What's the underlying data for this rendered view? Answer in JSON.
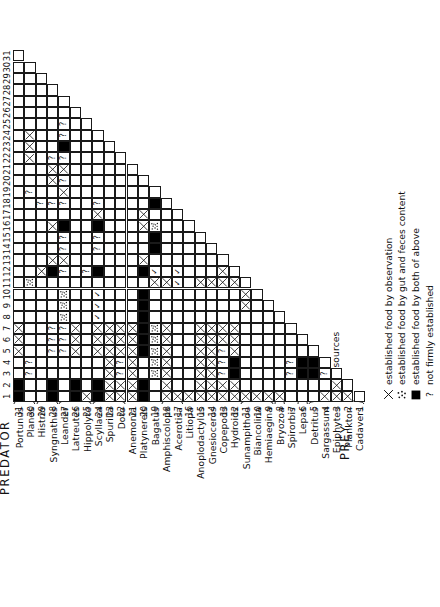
{
  "figure": {
    "predator_axis_label": "PREDATOR",
    "prey_axis_label": "PREY"
  },
  "taxa": [
    {
      "n": 1,
      "name": "Portunus"
    },
    {
      "n": 2,
      "name": "Planes"
    },
    {
      "n": 3,
      "name": "Histrio"
    },
    {
      "n": 4,
      "name": "Syngnathus"
    },
    {
      "n": 5,
      "name": "Leander"
    },
    {
      "n": 6,
      "name": "Latreutes"
    },
    {
      "n": 7,
      "name": "Hippolyte"
    },
    {
      "n": 8,
      "name": "Scyllaea"
    },
    {
      "n": 9,
      "name": "Spurilla"
    },
    {
      "n": 10,
      "name": "Doto"
    },
    {
      "n": 11,
      "name": "Anemonia"
    },
    {
      "n": 12,
      "name": "Platynereis"
    },
    {
      "n": 13,
      "name": "Bagatus"
    },
    {
      "n": 14,
      "name": "Amphiscolops"
    },
    {
      "n": 15,
      "name": "Acerotisa"
    },
    {
      "n": 16,
      "name": "Litiopa"
    },
    {
      "n": 17,
      "name": "Anoplodactylus"
    },
    {
      "n": 18,
      "name": "Gnesioceros"
    },
    {
      "n": 19,
      "name": "Copepods"
    },
    {
      "n": 20,
      "name": "Hydroids"
    },
    {
      "n": 21,
      "name": "Sunampithoe"
    },
    {
      "n": 22,
      "name": "Biancolina"
    },
    {
      "n": 23,
      "name": "Hemiaegina"
    },
    {
      "n": 24,
      "name": "Bryozoa"
    },
    {
      "n": 25,
      "name": "Spirorbis"
    },
    {
      "n": 26,
      "name": "Lepas"
    },
    {
      "n": 27,
      "name": "Detritus"
    },
    {
      "n": 28,
      "name": "Sargassum"
    },
    {
      "n": 29,
      "name": "Epiphytes"
    },
    {
      "n": 30,
      "name": "Plankton"
    },
    {
      "n": 31,
      "name": "Cadavers"
    }
  ],
  "groups": [
    {
      "label": "Crabs",
      "from": 1,
      "to": 2
    },
    {
      "label": "Fish",
      "from": 3,
      "to": 4
    },
    {
      "label": "Shrimp",
      "from": 5,
      "to": 7
    },
    {
      "label": "Nudibranches",
      "from": 8,
      "to": 10
    },
    {
      "label": "Flatworms",
      "from": 14,
      "to": 15
    },
    {
      "label": "Amphipods",
      "from": 21,
      "to": 23
    },
    {
      "label": "Tapeworm",
      "from": 24,
      "to": 24
    },
    {
      "label": "Barnacle",
      "from": 26,
      "to": 26
    },
    {
      "label": "Food sources",
      "from": 27,
      "to": 31
    }
  ],
  "legend": [
    {
      "key": "x",
      "text": "established food by observation"
    },
    {
      "key": "dots",
      "text": "established food by gut and feces content"
    },
    {
      "key": "solid",
      "text": "established food by both of above"
    },
    {
      "key": "q",
      "text": "not firmly established"
    }
  ],
  "chart_data": {
    "type": "heatmap",
    "xlabel": "PREDATOR",
    "ylabel": "PREY",
    "x": [
      1,
      2,
      3,
      4,
      5,
      6,
      7,
      8,
      9,
      10,
      11,
      12,
      13,
      14,
      15,
      16,
      17,
      18,
      19,
      20,
      21,
      22,
      23,
      24,
      25,
      26,
      27,
      28,
      29,
      30,
      31
    ],
    "y": [
      1,
      2,
      3,
      4,
      5,
      6,
      7,
      8,
      9,
      10,
      11,
      12,
      13,
      14,
      15,
      16,
      17,
      18,
      19,
      20,
      21,
      22,
      23,
      24,
      25,
      26,
      27,
      28,
      29,
      30,
      31
    ],
    "symbols": {
      "x": "established food by observation",
      "dots": "established food by gut and feces content",
      "solid": "established food by both of above",
      "q": "not firmly established",
      "empty": "no record"
    },
    "note": "Lower-left triangular matrix: cells exist where prey row index <= predator column index boundary (staircase).",
    "cells": [
      {
        "prey": 31,
        "predator": 1,
        "v": "solid"
      },
      {
        "prey": 31,
        "predator": 2,
        "v": "solid"
      },
      {
        "prey": 31,
        "predator": 5,
        "v": "x"
      },
      {
        "prey": 31,
        "predator": 6,
        "v": "x"
      },
      {
        "prey": 31,
        "predator": 7,
        "v": "x"
      },
      {
        "prey": 30,
        "predator": 3,
        "v": "q"
      },
      {
        "prey": 30,
        "predator": 4,
        "v": "q"
      },
      {
        "prey": 30,
        "predator": 11,
        "v": "dots"
      },
      {
        "prey": 30,
        "predator": 19,
        "v": "q"
      },
      {
        "prey": 30,
        "predator": 22,
        "v": "x"
      },
      {
        "prey": 30,
        "predator": 23,
        "v": "x"
      },
      {
        "prey": 30,
        "predator": 24,
        "v": "x"
      },
      {
        "prey": 29,
        "predator": 12,
        "v": "x"
      },
      {
        "prey": 29,
        "predator": 18,
        "v": "q"
      },
      {
        "prey": 28,
        "predator": 1,
        "v": "solid"
      },
      {
        "prey": 28,
        "predator": 2,
        "v": "solid"
      },
      {
        "prey": 28,
        "predator": 5,
        "v": "q"
      },
      {
        "prey": 28,
        "predator": 6,
        "v": "q"
      },
      {
        "prey": 28,
        "predator": 7,
        "v": "q"
      },
      {
        "prey": 28,
        "predator": 12,
        "v": "solid"
      },
      {
        "prey": 28,
        "predator": 13,
        "v": "x"
      },
      {
        "prey": 28,
        "predator": 16,
        "v": "x"
      },
      {
        "prey": 28,
        "predator": 18,
        "v": "q"
      },
      {
        "prey": 28,
        "predator": 20,
        "v": "x"
      },
      {
        "prey": 28,
        "predator": 21,
        "v": "x"
      },
      {
        "prey": 28,
        "predator": 22,
        "v": "q"
      },
      {
        "prey": 27,
        "predator": 5,
        "v": "q"
      },
      {
        "prey": 27,
        "predator": 6,
        "v": "q"
      },
      {
        "prey": 27,
        "predator": 7,
        "v": "q"
      },
      {
        "prey": 27,
        "predator": 8,
        "v": "dots"
      },
      {
        "prey": 27,
        "predator": 9,
        "v": "dots"
      },
      {
        "prey": 27,
        "predator": 10,
        "v": "dots"
      },
      {
        "prey": 27,
        "predator": 12,
        "v": "q"
      },
      {
        "prey": 27,
        "predator": 13,
        "v": "x"
      },
      {
        "prey": 27,
        "predator": 14,
        "v": "q"
      },
      {
        "prey": 27,
        "predator": 15,
        "v": "q"
      },
      {
        "prey": 27,
        "predator": 16,
        "v": "solid"
      },
      {
        "prey": 27,
        "predator": 18,
        "v": "q"
      },
      {
        "prey": 27,
        "predator": 19,
        "v": "x"
      },
      {
        "prey": 27,
        "predator": 20,
        "v": "q"
      },
      {
        "prey": 27,
        "predator": 21,
        "v": "x"
      },
      {
        "prey": 27,
        "predator": 22,
        "v": "q"
      },
      {
        "prey": 27,
        "predator": 23,
        "v": "solid"
      },
      {
        "prey": 27,
        "predator": 24,
        "v": "q"
      },
      {
        "prey": 27,
        "predator": 25,
        "v": "q"
      },
      {
        "prey": 26,
        "predator": 1,
        "v": "solid"
      },
      {
        "prey": 26,
        "predator": 2,
        "v": "solid"
      },
      {
        "prey": 26,
        "predator": 5,
        "v": "x"
      },
      {
        "prey": 26,
        "predator": 6,
        "v": "x"
      },
      {
        "prey": 26,
        "predator": 7,
        "v": "x"
      },
      {
        "prey": 25,
        "predator": 1,
        "v": "x"
      },
      {
        "prey": 25,
        "predator": 12,
        "v": "q"
      },
      {
        "prey": 24,
        "predator": 1,
        "v": "solid"
      },
      {
        "prey": 24,
        "predator": 2,
        "v": "solid"
      },
      {
        "prey": 24,
        "predator": 5,
        "v": "x"
      },
      {
        "prey": 24,
        "predator": 6,
        "v": "x"
      },
      {
        "prey": 24,
        "predator": 7,
        "v": "x"
      },
      {
        "prey": 24,
        "predator": 8,
        "v": "chk"
      },
      {
        "prey": 24,
        "predator": 9,
        "v": "chk"
      },
      {
        "prey": 24,
        "predator": 10,
        "v": "chk"
      },
      {
        "prey": 24,
        "predator": 12,
        "v": "solid"
      },
      {
        "prey": 24,
        "predator": 14,
        "v": "q"
      },
      {
        "prey": 24,
        "predator": 15,
        "v": "q"
      },
      {
        "prey": 24,
        "predator": 16,
        "v": "solid"
      },
      {
        "prey": 24,
        "predator": 17,
        "v": "x"
      },
      {
        "prey": 24,
        "predator": 18,
        "v": "q"
      },
      {
        "prey": 23,
        "predator": 1,
        "v": "x"
      },
      {
        "prey": 23,
        "predator": 2,
        "v": "x"
      },
      {
        "prey": 23,
        "predator": 3,
        "v": "x"
      },
      {
        "prey": 23,
        "predator": 4,
        "v": "x"
      },
      {
        "prey": 23,
        "predator": 5,
        "v": "x"
      },
      {
        "prey": 23,
        "predator": 6,
        "v": "x"
      },
      {
        "prey": 23,
        "predator": 7,
        "v": "x"
      },
      {
        "prey": 22,
        "predator": 1,
        "v": "x"
      },
      {
        "prey": 22,
        "predator": 2,
        "v": "x"
      },
      {
        "prey": 22,
        "predator": 3,
        "v": "q"
      },
      {
        "prey": 22,
        "predator": 4,
        "v": "q"
      },
      {
        "prey": 22,
        "predator": 5,
        "v": "x"
      },
      {
        "prey": 22,
        "predator": 6,
        "v": "x"
      },
      {
        "prey": 22,
        "predator": 7,
        "v": "x"
      },
      {
        "prey": 21,
        "predator": 1,
        "v": "x"
      },
      {
        "prey": 21,
        "predator": 2,
        "v": "x"
      },
      {
        "prey": 21,
        "predator": 3,
        "v": "x"
      },
      {
        "prey": 21,
        "predator": 4,
        "v": "x"
      },
      {
        "prey": 21,
        "predator": 5,
        "v": "x"
      },
      {
        "prey": 21,
        "predator": 6,
        "v": "x"
      },
      {
        "prey": 21,
        "predator": 7,
        "v": "x"
      },
      {
        "prey": 20,
        "predator": 1,
        "v": "solid"
      },
      {
        "prey": 20,
        "predator": 2,
        "v": "solid"
      },
      {
        "prey": 20,
        "predator": 5,
        "v": "solid"
      },
      {
        "prey": 20,
        "predator": 6,
        "v": "solid"
      },
      {
        "prey": 20,
        "predator": 7,
        "v": "solid"
      },
      {
        "prey": 20,
        "predator": 8,
        "v": "solid"
      },
      {
        "prey": 20,
        "predator": 9,
        "v": "solid"
      },
      {
        "prey": 20,
        "predator": 10,
        "v": "solid"
      },
      {
        "prey": 20,
        "predator": 12,
        "v": "solid"
      },
      {
        "prey": 20,
        "predator": 13,
        "v": "x"
      },
      {
        "prey": 20,
        "predator": 16,
        "v": "x"
      },
      {
        "prey": 20,
        "predator": 17,
        "v": "x"
      },
      {
        "prey": 19,
        "predator": 3,
        "v": "dots"
      },
      {
        "prey": 19,
        "predator": 4,
        "v": "dots"
      },
      {
        "prey": 19,
        "predator": 5,
        "v": "dots"
      },
      {
        "prey": 19,
        "predator": 6,
        "v": "dots"
      },
      {
        "prey": 19,
        "predator": 7,
        "v": "dots"
      },
      {
        "prey": 19,
        "predator": 11,
        "v": "x"
      },
      {
        "prey": 19,
        "predator": 12,
        "v": "chk"
      },
      {
        "prey": 19,
        "predator": 14,
        "v": "solid"
      },
      {
        "prey": 19,
        "predator": 15,
        "v": "solid"
      },
      {
        "prey": 19,
        "predator": 16,
        "v": "dots"
      },
      {
        "prey": 19,
        "predator": 18,
        "v": "solid"
      },
      {
        "prey": 18,
        "predator": 1,
        "v": "x"
      },
      {
        "prey": 18,
        "predator": 2,
        "v": "x"
      },
      {
        "prey": 18,
        "predator": 3,
        "v": "x"
      },
      {
        "prey": 18,
        "predator": 4,
        "v": "x"
      },
      {
        "prey": 18,
        "predator": 5,
        "v": "x"
      },
      {
        "prey": 18,
        "predator": 6,
        "v": "x"
      },
      {
        "prey": 18,
        "predator": 7,
        "v": "x"
      },
      {
        "prey": 18,
        "predator": 11,
        "v": "x"
      },
      {
        "prey": 17,
        "predator": 1,
        "v": "x"
      },
      {
        "prey": 17,
        "predator": 11,
        "v": "chk"
      },
      {
        "prey": 17,
        "predator": 12,
        "v": "chk"
      },
      {
        "prey": 16,
        "predator": 1,
        "v": "x"
      },
      {
        "prey": 15,
        "predator": 1,
        "v": "x"
      },
      {
        "prey": 15,
        "predator": 2,
        "v": "x"
      },
      {
        "prey": 15,
        "predator": 3,
        "v": "x"
      },
      {
        "prey": 15,
        "predator": 4,
        "v": "x"
      },
      {
        "prey": 15,
        "predator": 5,
        "v": "x"
      },
      {
        "prey": 15,
        "predator": 6,
        "v": "x"
      },
      {
        "prey": 15,
        "predator": 7,
        "v": "x"
      },
      {
        "prey": 15,
        "predator": 11,
        "v": "x"
      },
      {
        "prey": 14,
        "predator": 1,
        "v": "x"
      },
      {
        "prey": 14,
        "predator": 2,
        "v": "x"
      },
      {
        "prey": 14,
        "predator": 3,
        "v": "x"
      },
      {
        "prey": 14,
        "predator": 4,
        "v": "x"
      },
      {
        "prey": 14,
        "predator": 5,
        "v": "x"
      },
      {
        "prey": 14,
        "predator": 6,
        "v": "x"
      },
      {
        "prey": 14,
        "predator": 7,
        "v": "x"
      },
      {
        "prey": 14,
        "predator": 11,
        "v": "x"
      },
      {
        "prey": 13,
        "predator": 1,
        "v": "x"
      },
      {
        "prey": 13,
        "predator": 2,
        "v": "x"
      },
      {
        "prey": 13,
        "predator": 3,
        "v": "q"
      },
      {
        "prey": 13,
        "predator": 4,
        "v": "q"
      },
      {
        "prey": 13,
        "predator": 5,
        "v": "q"
      },
      {
        "prey": 13,
        "predator": 6,
        "v": "x"
      },
      {
        "prey": 13,
        "predator": 7,
        "v": "x"
      },
      {
        "prey": 13,
        "predator": 11,
        "v": "x"
      },
      {
        "prey": 13,
        "predator": 12,
        "v": "x"
      },
      {
        "prey": 12,
        "predator": 1,
        "v": "x"
      },
      {
        "prey": 12,
        "predator": 2,
        "v": "x"
      },
      {
        "prey": 12,
        "predator": 3,
        "v": "solid"
      },
      {
        "prey": 12,
        "predator": 4,
        "v": "solid"
      },
      {
        "prey": 12,
        "predator": 5,
        "v": "x"
      },
      {
        "prey": 12,
        "predator": 6,
        "v": "x"
      },
      {
        "prey": 12,
        "predator": 7,
        "v": "x"
      },
      {
        "prey": 12,
        "predator": 11,
        "v": "x"
      },
      {
        "prey": 11,
        "predator": 1,
        "v": "x"
      },
      {
        "prey": 11,
        "predator": 9,
        "v": "x"
      },
      {
        "prey": 11,
        "predator": 10,
        "v": "x"
      },
      {
        "prey": 10,
        "predator": 1,
        "v": "x"
      },
      {
        "prey": 9,
        "predator": 1,
        "v": "x"
      },
      {
        "prey": 8,
        "predator": 1,
        "v": "x"
      },
      {
        "prey": 7,
        "predator": 3,
        "v": "q"
      },
      {
        "prey": 7,
        "predator": 4,
        "v": "q"
      },
      {
        "prey": 6,
        "predator": 3,
        "v": "solid"
      },
      {
        "prey": 6,
        "predator": 4,
        "v": "solid"
      },
      {
        "prey": 5,
        "predator": 3,
        "v": "solid"
      },
      {
        "prey": 5,
        "predator": 4,
        "v": "solid"
      },
      {
        "prey": 4,
        "predator": 1,
        "v": "x"
      },
      {
        "prey": 4,
        "predator": 3,
        "v": "q"
      },
      {
        "prey": 3,
        "predator": 1,
        "v": "x"
      },
      {
        "prey": 3,
        "predator": 2,
        "v": "x"
      },
      {
        "prey": 2,
        "predator": 1,
        "v": "x"
      }
    ],
    "row_extent": [
      {
        "prey": 31,
        "max_predator": 31
      },
      {
        "prey": 30,
        "max_predator": 30
      },
      {
        "prey": 29,
        "max_predator": 29
      },
      {
        "prey": 28,
        "max_predator": 28
      },
      {
        "prey": 27,
        "max_predator": 27
      },
      {
        "prey": 26,
        "max_predator": 26
      },
      {
        "prey": 25,
        "max_predator": 25
      },
      {
        "prey": 24,
        "max_predator": 24
      },
      {
        "prey": 23,
        "max_predator": 23
      },
      {
        "prey": 22,
        "max_predator": 22
      },
      {
        "prey": 21,
        "max_predator": 21
      },
      {
        "prey": 20,
        "max_predator": 20
      },
      {
        "prey": 19,
        "max_predator": 19
      },
      {
        "prey": 18,
        "max_predator": 18
      },
      {
        "prey": 17,
        "max_predator": 17
      },
      {
        "prey": 16,
        "max_predator": 16
      },
      {
        "prey": 15,
        "max_predator": 15
      },
      {
        "prey": 14,
        "max_predator": 14
      },
      {
        "prey": 13,
        "max_predator": 13
      },
      {
        "prey": 12,
        "max_predator": 12
      },
      {
        "prey": 11,
        "max_predator": 11
      },
      {
        "prey": 10,
        "max_predator": 10
      },
      {
        "prey": 9,
        "max_predator": 9
      },
      {
        "prey": 8,
        "max_predator": 8
      },
      {
        "prey": 7,
        "max_predator": 7
      },
      {
        "prey": 6,
        "max_predator": 6
      },
      {
        "prey": 5,
        "max_predator": 5
      },
      {
        "prey": 4,
        "max_predator": 4
      },
      {
        "prey": 3,
        "max_predator": 3
      },
      {
        "prey": 2,
        "max_predator": 2
      },
      {
        "prey": 1,
        "max_predator": 1
      }
    ]
  }
}
